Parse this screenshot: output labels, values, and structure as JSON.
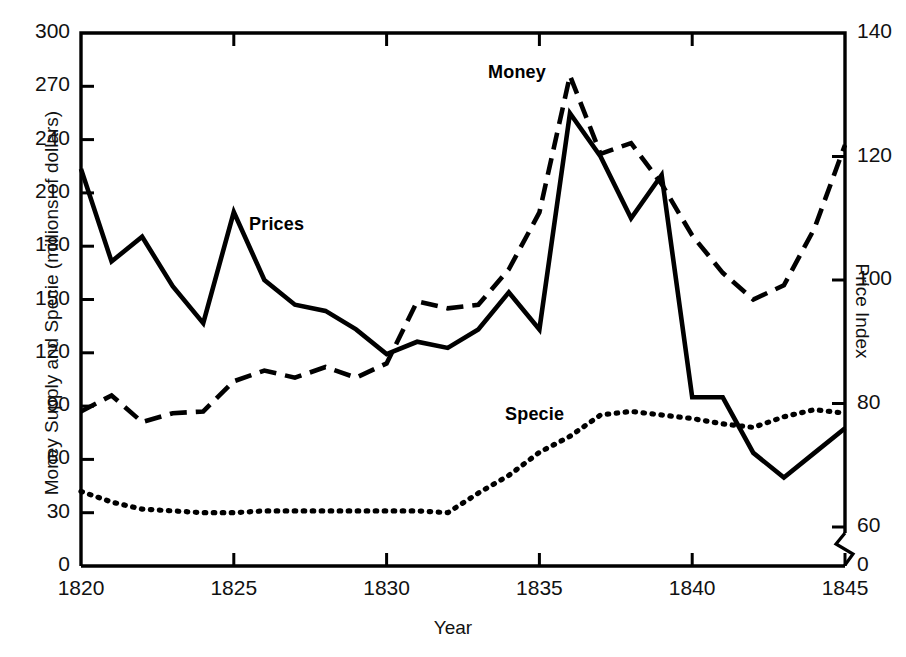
{
  "chart_data": {
    "type": "line",
    "title": "",
    "xlabel": "Year",
    "ylabel": "Money Supply and Specie (millions of dollars)",
    "ylabel_right": "Price Index",
    "xlim": [
      1820,
      1845
    ],
    "ylim": [
      0,
      300
    ],
    "ylim_right": [
      0,
      140
    ],
    "yticks": [
      0,
      30,
      60,
      90,
      120,
      150,
      180,
      210,
      240,
      270,
      300
    ],
    "ytick_labels": [
      "0",
      "30",
      "60",
      "90",
      "120",
      "150",
      "180",
      "210",
      "240",
      "270",
      "300"
    ],
    "yticks_right": [
      0,
      60,
      80,
      100,
      120,
      140
    ],
    "ytick_labels_right": [
      "0",
      "60",
      "80",
      "100",
      "120",
      "140"
    ],
    "right_axis_break": true,
    "right_axis_break_note": "axis break between 0 and 60",
    "xticks": [
      1820,
      1825,
      1830,
      1835,
      1840,
      1845
    ],
    "xtick_labels": [
      "1820",
      "1825",
      "1830",
      "1835",
      "1840",
      "1845"
    ],
    "grid": false,
    "legend_position": "inline-annotations",
    "x": [
      1820,
      1821,
      1822,
      1823,
      1824,
      1825,
      1826,
      1827,
      1828,
      1829,
      1830,
      1831,
      1832,
      1833,
      1834,
      1835,
      1836,
      1837,
      1838,
      1839,
      1840,
      1841,
      1842,
      1843,
      1844,
      1845
    ],
    "series": [
      {
        "name": "Prices",
        "axis": "right",
        "unit": "price index",
        "linestyle": "solid",
        "color": "#000000",
        "label_text": "Prices",
        "values": [
          118,
          103,
          107,
          99,
          93,
          111,
          100,
          96,
          95,
          92,
          88,
          90,
          89,
          92,
          98,
          92,
          127,
          120,
          110,
          117,
          81,
          81,
          72,
          68,
          72,
          76
        ]
      },
      {
        "name": "Money",
        "axis": "left",
        "unit": "millions of dollars",
        "linestyle": "dashed",
        "color": "#000000",
        "label_text": "Money",
        "values": [
          87,
          96,
          81,
          86,
          87,
          104,
          110,
          106,
          112,
          106,
          114,
          149,
          145,
          147,
          167,
          199,
          276,
          232,
          238,
          215,
          186,
          165,
          150,
          158,
          190,
          237
        ]
      },
      {
        "name": "Specie",
        "axis": "left",
        "unit": "millions of dollars",
        "linestyle": "dotted",
        "color": "#000000",
        "label_text": "Specie",
        "values": [
          42,
          36,
          32,
          31,
          30,
          30,
          31,
          31,
          31,
          31,
          31,
          31,
          30,
          41,
          51,
          64,
          73,
          85,
          87,
          85,
          83,
          80,
          78,
          84,
          88,
          86
        ]
      }
    ]
  },
  "axes": {
    "left_title": "Money Supply and Specie (millions of dollars)",
    "right_title": "Price Index",
    "bottom_title": "Year"
  },
  "annotations": {
    "money": "Money",
    "prices": "Prices",
    "specie": "Specie"
  },
  "colors": {
    "frame": "#000000",
    "text": "#111111",
    "background": "#ffffff"
  }
}
